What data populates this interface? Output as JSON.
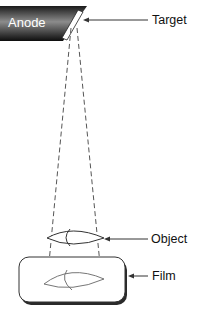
{
  "diagram": {
    "type": "x-ray projection geometry",
    "labels": {
      "anode": "Anode",
      "target": "Target",
      "object": "Object",
      "film": "Film"
    },
    "colors": {
      "anode_dark": "#111111",
      "anode_light": "#8a8a8a",
      "line": "#333333",
      "dash": "#555555",
      "object_stroke": "#444444",
      "film_stroke": "#333333"
    }
  }
}
